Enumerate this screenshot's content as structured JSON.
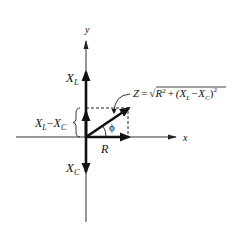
{
  "diagram": {
    "axes": {
      "x_label": "x",
      "y_label": "y"
    },
    "vectors": {
      "inductive_reactance": {
        "label_main": "X",
        "label_sub": "L"
      },
      "capacitive_reactance": {
        "label_main": "X",
        "label_sub": "C"
      },
      "resistance": {
        "label": "R"
      },
      "impedance": {
        "label": "Z"
      }
    },
    "difference_label": {
      "x1": "X",
      "s1": "L",
      "minus": "−",
      "x2": "X",
      "s2": "C"
    },
    "angle_label": "ϕ",
    "formula": {
      "lhs": "Z",
      "equals": "=",
      "sqrt": "√",
      "r": "R",
      "sq1": "2",
      "plus": "+",
      "open": "(X",
      "sub_l": "L",
      "minus": "−",
      "xc": "X",
      "sub_c": "C",
      "close": ")",
      "sq2": "2"
    },
    "colors": {
      "line": "#111111",
      "axis": "#333333"
    }
  }
}
